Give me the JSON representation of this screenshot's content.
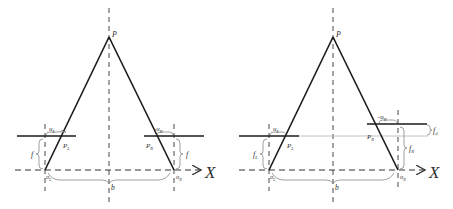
{
  "figure": {
    "panels": [
      {
        "id": "left",
        "description": "Parallel stereo camera geometry (equal focal lengths)",
        "labels": {
          "apex": "P",
          "u_left": "u",
          "u_left_sub": "L",
          "u_right": "-u",
          "u_right_sub": "R",
          "p_left": "P",
          "p_left_sub": "L",
          "p_right": "P",
          "p_right_sub": "R",
          "f_left": "f",
          "f_right": "f",
          "o_left": "o",
          "o_left_sub": "L",
          "o_right": "o",
          "o_right_sub": "R",
          "baseline": "b",
          "axis": "X"
        }
      },
      {
        "id": "right",
        "description": "Stereo camera geometry with differing focal lengths",
        "labels": {
          "apex": "P",
          "u_left": "u",
          "u_left_sub": "L",
          "u_right": "-u",
          "u_right_sub": "R",
          "p_left": "P",
          "p_left_sub": "L",
          "p_right": "P",
          "p_right_sub": "R",
          "f_left": "f",
          "f_left_sub": "L",
          "f_right": "f",
          "f_right_sub": "R",
          "f_diff": "f",
          "f_diff_sub": "d",
          "o_left": "o",
          "o_left_sub": "L",
          "o_right": "o",
          "o_right_sub": "R",
          "baseline": "b",
          "axis": "X"
        }
      }
    ],
    "colors": {
      "line": "#1a1a1a",
      "dashed": "#333333",
      "brace": "#888888",
      "dotted_extension": "#bbbbbb"
    }
  }
}
